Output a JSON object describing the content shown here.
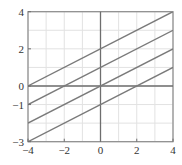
{
  "chart_data": {
    "type": "line",
    "title": "",
    "xlabel": "",
    "ylabel": "",
    "xlim": [
      -4,
      4
    ],
    "ylim": [
      -3,
      4
    ],
    "grid": true,
    "grid_step": 1,
    "x_ticks": [
      -4,
      -2,
      0,
      2,
      4
    ],
    "y_ticks": [
      4,
      2,
      0,
      -1,
      -3
    ],
    "x_tick_labels": [
      "−4",
      "−2",
      "0",
      "2",
      "4"
    ],
    "y_tick_labels": [
      "4",
      "2",
      "0",
      "−1",
      "−3"
    ],
    "series": [
      {
        "name": "y = x/2 + 2",
        "slope": 0.5,
        "intercept": 2,
        "x": [
          -4,
          4
        ],
        "values": [
          0,
          4
        ]
      },
      {
        "name": "y = x/2 + 1",
        "slope": 0.5,
        "intercept": 1,
        "x": [
          -4,
          4
        ],
        "values": [
          -1,
          3
        ]
      },
      {
        "name": "y = x/2",
        "slope": 0.5,
        "intercept": 0,
        "x": [
          -4,
          4
        ],
        "values": [
          -2,
          2
        ]
      },
      {
        "name": "y = x/2 - 1",
        "slope": 0.5,
        "intercept": -1,
        "x": [
          -4,
          4
        ],
        "values": [
          -3,
          1
        ]
      }
    ],
    "colors": {
      "line": "#7a7a7a",
      "grid": "#e2e2e2",
      "axis": "#6e6e6e",
      "frame": "#8a8a8a"
    },
    "legend": null
  }
}
